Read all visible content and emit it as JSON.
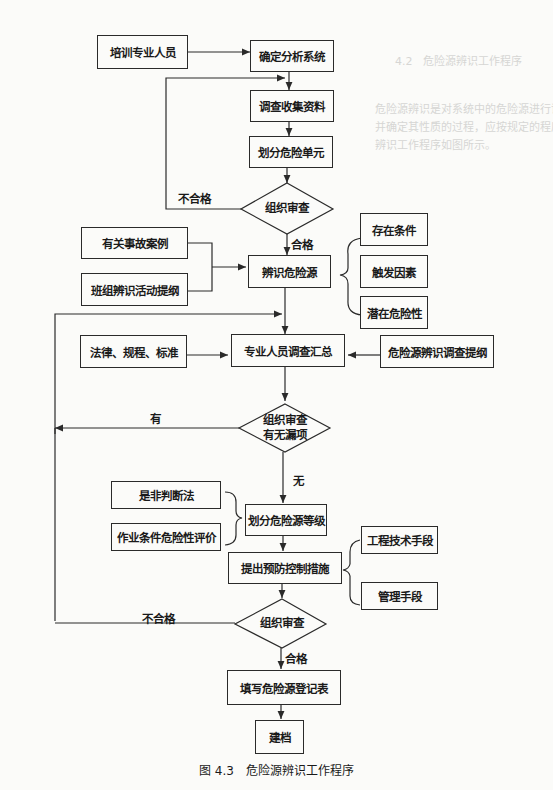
{
  "figure": {
    "caption": "图 4.3　危险源辨识工作程序",
    "nodes": {
      "train": "培训专业人员",
      "define_system": "确定分析系统",
      "collect_data": "调查收集资料",
      "divide_units": "划分危险单元",
      "review1": "组织审查",
      "accident_cases": "有关事故案例",
      "team_outline": "班组辨识活动提纲",
      "identify_hazards": "辨识危险源",
      "exist_conditions": "存在条件",
      "trigger_factors": "触发因素",
      "potential_danger": "潜在危险性",
      "laws": "法律、规程、标准",
      "expert_summary": "专业人员调查汇总",
      "survey_outline": "危险源辨识调查提纲",
      "review2_line1": "组织审查",
      "review2_line2": "有无漏项",
      "yes_no_method": "是非判断法",
      "lec_eval": "作业条件危险性评价",
      "classify": "划分危险源等级",
      "measures": "提出预防控制措施",
      "engineering": "工程技术手段",
      "management": "管理手段",
      "review3": "组织审查",
      "register": "填写危险源登记表",
      "archive": "建档"
    },
    "edge_labels": {
      "fail1": "不合格",
      "pass1": "合格",
      "has_omission": "有",
      "no_omission": "无",
      "fail3": "不合格",
      "pass3": "合格"
    }
  }
}
